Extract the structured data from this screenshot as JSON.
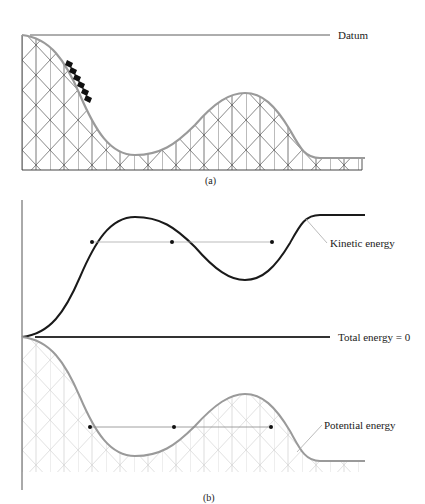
{
  "panel_a": {
    "caption": "(a)",
    "datum_label": "Datum"
  },
  "panel_b": {
    "caption": "(b)",
    "kinetic_label": "Kinetic energy",
    "total_label": "Total energy = 0",
    "potential_label": "Potential energy"
  },
  "colors": {
    "track": "#9a9a9a",
    "trestle_a": "#555555",
    "trestle_b": "#d4d4d4",
    "kinetic_curve": "#1a1a1a",
    "potential_curve": "#9a9a9a",
    "total_line": "#333333",
    "level_line": "#aaaaaa",
    "dot": "#111111"
  }
}
